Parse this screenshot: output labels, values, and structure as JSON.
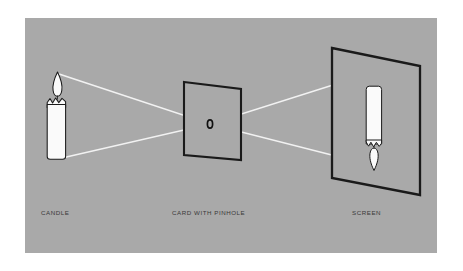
{
  "figure": {
    "background_color": "#ffffff",
    "panel_color": "#a9a9a9",
    "ink_color": "#1a1a1a",
    "ray_color": "#f2f2f2",
    "object_fill": "#fafafa",
    "label_color": "#3a3a3a"
  },
  "panel": {
    "x": 25,
    "y": 18,
    "width": 412,
    "height": 235
  },
  "labels": {
    "candle": "CANDLE",
    "card": "CARD WITH PINHOLE",
    "screen": "SCREEN"
  },
  "components": {
    "candle": {
      "name": "candle",
      "body": {
        "x": 47,
        "y": 96,
        "width": 16,
        "height": 62
      },
      "flame": {
        "cx": 57,
        "cy": 84,
        "rx": 4.5,
        "ry": 11
      },
      "description": "upright lit candle, object"
    },
    "card": {
      "name": "card-with-pinhole",
      "corners": [
        [
          184,
          82
        ],
        [
          241,
          89
        ],
        [
          241,
          160
        ],
        [
          184,
          155
        ]
      ],
      "pinhole": {
        "cx": 210,
        "cy": 124,
        "rx": 2.6,
        "ry": 4.0
      },
      "description": "opaque card pierced by a small pinhole"
    },
    "screen": {
      "name": "screen",
      "corners": [
        [
          332,
          48
        ],
        [
          420,
          66
        ],
        [
          420,
          195
        ],
        [
          332,
          178
        ]
      ],
      "image": {
        "body": {
          "x": 366,
          "y": 86,
          "width": 15,
          "height": 58
        },
        "flame": {
          "cx": 374,
          "cy": 156,
          "rx": 4.2,
          "ry": 10.5
        }
      },
      "description": "screen displaying an inverted real image of the candle"
    }
  },
  "rays": [
    {
      "name": "ray-top",
      "from": [
        59,
        74
      ],
      "via": [
        210,
        124
      ],
      "to": [
        374,
        72
      ],
      "meaning": "light from flame tip to bottom of image"
    },
    {
      "name": "ray-bottom",
      "from": [
        62,
        158
      ],
      "via": [
        210,
        124
      ],
      "to": [
        375,
        166
      ],
      "meaning": "light from candle base to top of image"
    }
  ],
  "caption_positions": {
    "candle": {
      "x": 41,
      "y": 215
    },
    "card": {
      "x": 172,
      "y": 215
    },
    "screen": {
      "x": 352,
      "y": 215
    }
  }
}
